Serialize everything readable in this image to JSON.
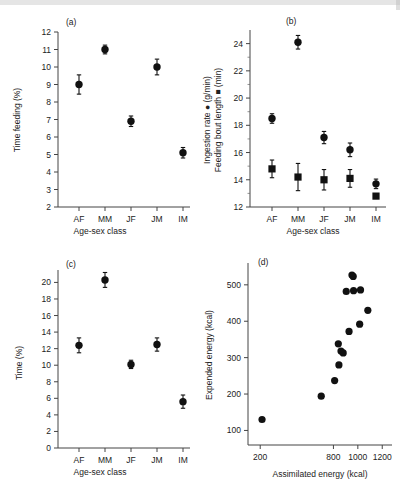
{
  "figure": {
    "categories": [
      "AF",
      "MM",
      "JF",
      "JM",
      "IM"
    ],
    "xlabel_agesex": "Age-sex class"
  },
  "chart_data": [
    {
      "type": "scatter",
      "panel": "(a)",
      "title": "",
      "xlabel": "Age-sex class",
      "ylabel": "Time feeding (%)",
      "categories": [
        "AF",
        "MM",
        "JF",
        "JM",
        "IM"
      ],
      "values": [
        9.0,
        11.0,
        6.9,
        10.0,
        5.1
      ],
      "errors": [
        0.55,
        0.25,
        0.3,
        0.45,
        0.3
      ],
      "ylim": [
        2,
        12
      ],
      "yticks": [
        2,
        3,
        4,
        5,
        6,
        7,
        8,
        9,
        10,
        11,
        12
      ],
      "grid": false,
      "marker": "circle"
    },
    {
      "type": "scatter",
      "panel": "(b)",
      "title": "",
      "xlabel": "Age-sex class",
      "ylabel": "Ingestion rate ● (g/min)  Feeding bout length ■ (min)",
      "ylabel_line1": "Ingestion rate ● (g/min)",
      "ylabel_line2": "Feeding bout length ■ (min)",
      "categories": [
        "AF",
        "MM",
        "JF",
        "JM",
        "IM"
      ],
      "series": [
        {
          "name": "Ingestion rate (g/min)",
          "marker": "circle",
          "values": [
            18.5,
            24.1,
            17.1,
            16.2,
            13.7
          ],
          "errors": [
            0.35,
            0.5,
            0.45,
            0.5,
            0.35
          ]
        },
        {
          "name": "Feeding bout length (min)",
          "marker": "square",
          "values": [
            14.8,
            14.2,
            14.0,
            14.1,
            12.8
          ],
          "errors": [
            0.65,
            1.0,
            0.75,
            0.65,
            0.0
          ]
        }
      ],
      "ylim": [
        12,
        25
      ],
      "yticks": [
        12,
        14,
        16,
        18,
        20,
        22,
        24
      ],
      "grid": false
    },
    {
      "type": "scatter",
      "panel": "(c)",
      "title": "",
      "xlabel": "Age-sex class",
      "ylabel": "Time (%)",
      "categories": [
        "AF",
        "MM",
        "JF",
        "JM",
        "IM"
      ],
      "values": [
        12.4,
        20.3,
        10.1,
        12.5,
        5.6
      ],
      "errors": [
        0.9,
        0.9,
        0.5,
        0.8,
        0.8
      ],
      "ylim": [
        0,
        21.5
      ],
      "yticks": [
        0,
        2,
        4,
        6,
        8,
        10,
        12,
        14,
        16,
        18,
        20
      ],
      "grid": false,
      "marker": "circle"
    },
    {
      "type": "scatter",
      "panel": "(d)",
      "title": "",
      "xlabel": "Assimilated energy (kcal)",
      "ylabel": "Expended energy (kcal)",
      "xticks": [
        200,
        800,
        1000,
        1200
      ],
      "yticks": [
        100,
        200,
        300,
        400,
        500
      ],
      "xlim": [
        100,
        1280
      ],
      "ylim": [
        60,
        560
      ],
      "grid": false,
      "marker": "circle",
      "points": [
        {
          "x": 215,
          "y": 130
        },
        {
          "x": 700,
          "y": 194
        },
        {
          "x": 810,
          "y": 237
        },
        {
          "x": 845,
          "y": 280
        },
        {
          "x": 840,
          "y": 338
        },
        {
          "x": 862,
          "y": 318
        },
        {
          "x": 880,
          "y": 313
        },
        {
          "x": 905,
          "y": 482
        },
        {
          "x": 928,
          "y": 372
        },
        {
          "x": 952,
          "y": 527
        },
        {
          "x": 962,
          "y": 523
        },
        {
          "x": 965,
          "y": 484
        },
        {
          "x": 1015,
          "y": 392
        },
        {
          "x": 1022,
          "y": 486
        },
        {
          "x": 1082,
          "y": 430
        }
      ]
    }
  ]
}
